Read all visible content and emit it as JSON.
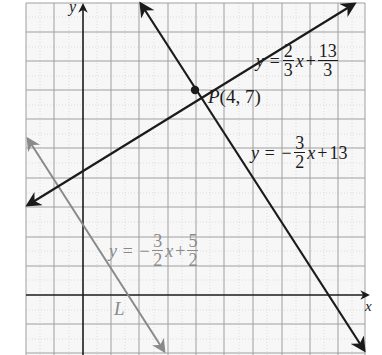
{
  "figure": {
    "grid": {
      "x_min": -2,
      "x_max": 10,
      "y_min": -2,
      "y_max": 10,
      "step": 1
    },
    "axes": {
      "x_label": "x",
      "y_label": "y"
    },
    "colors": {
      "dark_line": "#1b1b1b",
      "gray_line": "#8a8a8a",
      "grid_major": "#9a9a9a",
      "grid_minor": "#c8c8c8",
      "background": "#f7f7f7"
    },
    "lines": [
      {
        "id": "line-a",
        "equation_prefix": "y =",
        "coef_num": "2",
        "coef_den": "3",
        "var": "x",
        "op": "+",
        "const_num": "13",
        "const_den": "3",
        "color": "dark"
      },
      {
        "id": "line-b",
        "equation_prefix": "y = −",
        "coef_num": "3",
        "coef_den": "2",
        "var": "x",
        "op": "+",
        "const": "13",
        "color": "dark"
      },
      {
        "id": "line-l",
        "equation_prefix": "y = −",
        "coef_num": "3",
        "coef_den": "2",
        "var": "x",
        "op": "+",
        "const_num": "5",
        "const_den": "2",
        "color": "gray",
        "name": "L"
      }
    ],
    "point": {
      "name": "P",
      "coords": "(4, 7)",
      "x": 4,
      "y": 7
    }
  }
}
